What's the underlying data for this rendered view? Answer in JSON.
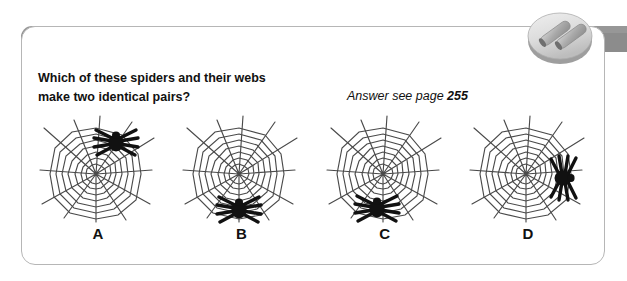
{
  "header": {
    "title": "PUZZLE 336",
    "bar_color": "#8c8c8c",
    "badge": {
      "icon": "two-rods-disc-icon",
      "rod_count": 2,
      "disc_color": "#d8d8d8",
      "rod_color": "#b0b0b0"
    }
  },
  "question": {
    "line1": "Which of these spiders and their webs",
    "line2": "make two identical pairs?"
  },
  "answer": {
    "prefix": "Answer see page",
    "page": "255"
  },
  "options": [
    {
      "label": "A",
      "web_icon": "spider-web-icon",
      "spider_icon": "spider-icon",
      "spider_position": "top-right",
      "spider_rotation_deg": 0
    },
    {
      "label": "B",
      "web_icon": "spider-web-icon",
      "spider_icon": "spider-icon",
      "spider_position": "bottom-center",
      "spider_rotation_deg": 0
    },
    {
      "label": "C",
      "web_icon": "spider-web-icon",
      "spider_icon": "spider-icon",
      "spider_position": "bottom-center-left",
      "spider_rotation_deg": 0
    },
    {
      "label": "D",
      "web_icon": "spider-web-icon",
      "spider_icon": "spider-icon",
      "spider_position": "right-middle",
      "spider_rotation_deg": 90
    }
  ],
  "colors": {
    "card_border": "#b6b6b6",
    "web_stroke": "#4a4a4a",
    "spider_fill": "#111111",
    "text": "#111111",
    "page_background": "#ffffff"
  }
}
